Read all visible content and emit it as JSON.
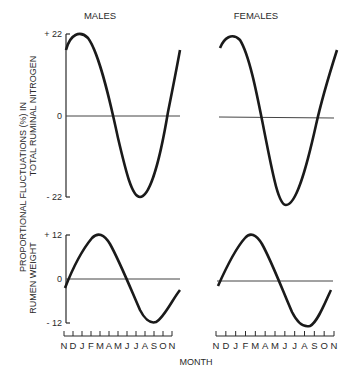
{
  "chart_data": [
    {
      "type": "line",
      "panel": "top-left",
      "title": "MALES",
      "ylabel": "PROPORTIONAL FLUCTUATIONS (%) IN TOTAL RUMINAL NITROGEN",
      "xlabel": "MONTH",
      "ylim": [
        -22,
        22
      ],
      "yticks": [
        "+ 22",
        "0",
        "- 22"
      ],
      "x": [
        "N",
        "D",
        "J",
        "F",
        "M",
        "A",
        "M",
        "J",
        "J",
        "A",
        "S",
        "O",
        "N"
      ],
      "values": [
        15,
        22,
        19,
        7,
        -5,
        -16,
        -22,
        -20,
        -10,
        2,
        12,
        18,
        15
      ]
    },
    {
      "type": "line",
      "panel": "top-right",
      "title": "FEMALES",
      "ylabel": "PROPORTIONAL FLUCTUATIONS (%) IN TOTAL RUMINAL NITROGEN",
      "xlabel": "MONTH",
      "ylim": [
        -22,
        22
      ],
      "x": [
        "N",
        "D",
        "J",
        "F",
        "M",
        "A",
        "M",
        "J",
        "J",
        "A",
        "S",
        "O",
        "N"
      ],
      "values": [
        16,
        22,
        18,
        8,
        -4,
        -15,
        -22,
        -22,
        -12,
        1,
        10,
        17,
        16
      ]
    },
    {
      "type": "line",
      "panel": "bottom-left",
      "title": "MALES",
      "ylabel": "PROPORTIONAL FLUCTUATIONS (%) IN RUMEN WEIGHT",
      "xlabel": "MONTH",
      "ylim": [
        -12,
        12
      ],
      "yticks": [
        "+ 12",
        "0",
        "- 12"
      ],
      "x": [
        "N",
        "D",
        "J",
        "F",
        "M",
        "A",
        "M",
        "J",
        "J",
        "A",
        "S",
        "O",
        "N"
      ],
      "values": [
        -3,
        4,
        9,
        12,
        10,
        5,
        0,
        -5,
        -10,
        -12,
        -10,
        -6,
        -3
      ]
    },
    {
      "type": "line",
      "panel": "bottom-right",
      "title": "FEMALES",
      "ylabel": "PROPORTIONAL FLUCTUATIONS (%) IN RUMEN WEIGHT",
      "xlabel": "MONTH",
      "ylim": [
        -12,
        12
      ],
      "x": [
        "N",
        "D",
        "J",
        "F",
        "M",
        "A",
        "M",
        "J",
        "J",
        "A",
        "S",
        "O",
        "N"
      ],
      "values": [
        -2,
        4,
        9,
        12,
        11,
        6,
        0,
        -6,
        -11,
        -13,
        -11,
        -6,
        -2
      ]
    }
  ],
  "labels": {
    "males": "MALES",
    "females": "FEMALES",
    "ylabel_line1": "PROPORTIONAL FLUCTUATIONS (%) IN",
    "ylabel_top_line2": "TOTAL RUMINAL NITROGEN",
    "ylabel_bottom_line2": "RUMEN WEIGHT",
    "xlabel": "MONTH",
    "top_ticks": {
      "max": "+ 22",
      "zero": "0",
      "min": "- 22"
    },
    "bottom_ticks": {
      "max": "+ 12",
      "zero": "0",
      "min": "- 12"
    },
    "months": [
      "N",
      "D",
      "J",
      "F",
      "M",
      "A",
      "M",
      "J",
      "J",
      "A",
      "S",
      "O",
      "N"
    ]
  },
  "colors": {
    "line": "#1a1a1a",
    "axis": "#2a2a2a",
    "zero_line": "#444444"
  }
}
